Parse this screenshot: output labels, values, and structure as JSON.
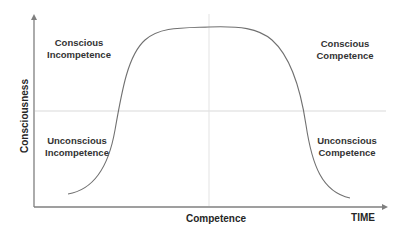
{
  "diagram": {
    "axes": {
      "y_label": "Consciousness",
      "x_label": "Competence",
      "x_end_label": "TIME"
    },
    "quadrants": [
      {
        "id": "top-left",
        "line1": "Conscious",
        "line2": "Incompetence"
      },
      {
        "id": "top-right",
        "line1": "Conscious",
        "line2": "Competence"
      },
      {
        "id": "bottom-left",
        "line1": "Unconscious",
        "line2": "Incompetence"
      },
      {
        "id": "bottom-right",
        "line1": "Unconscious",
        "line2": "Competence"
      }
    ],
    "colors": {
      "axis": "#7f7f7f",
      "curve": "#707070",
      "divider": "#d9d9d9",
      "text": "#333333"
    }
  }
}
